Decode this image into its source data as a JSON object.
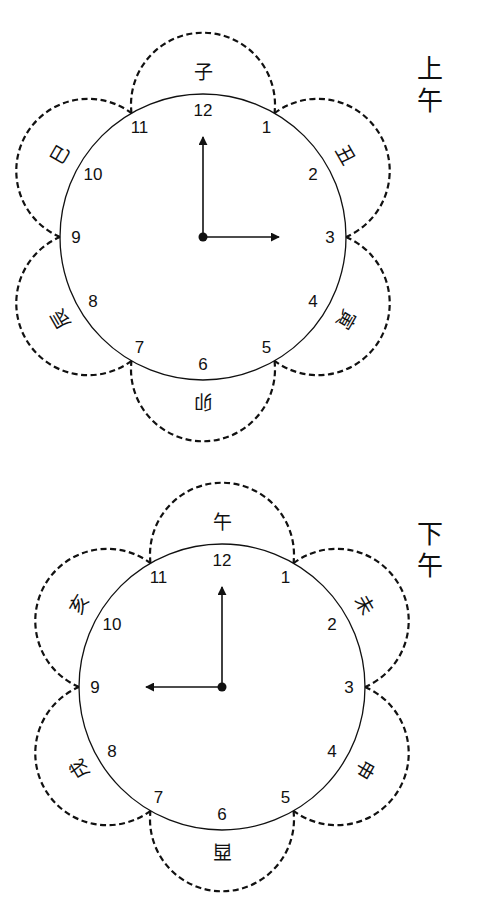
{
  "clocks": [
    {
      "id": "am",
      "period_label": [
        "上",
        "午"
      ],
      "center": [
        203,
        237
      ],
      "radius": 143,
      "numbers": [
        "12",
        "1",
        "2",
        "3",
        "4",
        "5",
        "6",
        "7",
        "8",
        "9",
        "10",
        "11"
      ],
      "branches": [
        {
          "char": "子",
          "between": [
            11,
            1
          ]
        },
        {
          "char": "丑",
          "between": [
            1,
            3
          ]
        },
        {
          "char": "寅",
          "between": [
            3,
            5
          ]
        },
        {
          "char": "卯",
          "between": [
            5,
            7
          ]
        },
        {
          "char": "辰",
          "between": [
            7,
            9
          ]
        },
        {
          "char": "巳",
          "between": [
            9,
            11
          ]
        }
      ],
      "hands": {
        "minute_points_to": 12,
        "hour_points_to": 3,
        "minute_length": 100,
        "hour_length": 76
      }
    },
    {
      "id": "pm",
      "period_label": [
        "下",
        "午"
      ],
      "center": [
        222,
        687
      ],
      "radius": 143,
      "numbers": [
        "12",
        "1",
        "2",
        "3",
        "4",
        "5",
        "6",
        "7",
        "8",
        "9",
        "10",
        "11"
      ],
      "branches": [
        {
          "char": "午",
          "between": [
            11,
            1
          ]
        },
        {
          "char": "未",
          "between": [
            1,
            3
          ]
        },
        {
          "char": "申",
          "between": [
            3,
            5
          ]
        },
        {
          "char": "酉",
          "between": [
            5,
            7
          ]
        },
        {
          "char": "戌",
          "between": [
            7,
            9
          ]
        },
        {
          "char": "亥",
          "between": [
            9,
            11
          ]
        }
      ],
      "hands": {
        "minute_points_to": 12,
        "hour_points_to": 9,
        "minute_length": 100,
        "hour_length": 76
      }
    }
  ],
  "colors": {
    "stroke": "#111111",
    "background": "#ffffff"
  }
}
